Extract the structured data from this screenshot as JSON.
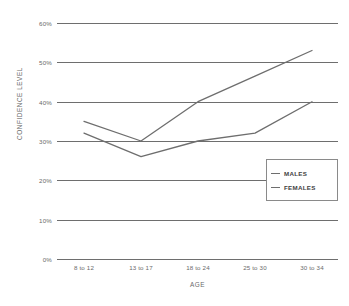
{
  "chart_data": {
    "type": "line",
    "title": "",
    "xlabel": "AGE",
    "ylabel": "CONFIDENCE LEVEL",
    "categories": [
      "8 to 12",
      "13 to 17",
      "18 to 24",
      "25 to 30",
      "30 to 34"
    ],
    "ylim": [
      0,
      60
    ],
    "ytick_labels": [
      "0%",
      "10%",
      "20%",
      "30%",
      "40%",
      "50%",
      "60%"
    ],
    "ytick_values": [
      0,
      10,
      20,
      30,
      40,
      50,
      60
    ],
    "grid": true,
    "legend_position": "right-middle",
    "series": [
      {
        "name": "MALES",
        "values": [
          35,
          30,
          40,
          46.5,
          53
        ],
        "color": "#6e6e6e"
      },
      {
        "name": "FEMALES",
        "values": [
          32,
          26,
          30,
          32,
          40
        ],
        "color": "#6e6e6e"
      }
    ]
  },
  "axes": {
    "y_title": "CONFIDENCE LEVEL",
    "x_title": "AGE",
    "y_ticks": [
      {
        "label": "60%",
        "value": 60
      },
      {
        "label": "50%",
        "value": 50
      },
      {
        "label": "40%",
        "value": 40
      },
      {
        "label": "30%",
        "value": 30
      },
      {
        "label": "20%",
        "value": 20
      },
      {
        "label": "10%",
        "value": 10
      },
      {
        "label": "0%",
        "value": 0
      }
    ],
    "x_ticks": [
      "8 to 12",
      "13 to 17",
      "18 to 24",
      "25 to 30",
      "30 to 34"
    ]
  },
  "legend": {
    "items": [
      {
        "label": "MALES",
        "color": "#6e6e6e"
      },
      {
        "label": "FEMALES",
        "color": "#6e6e6e"
      }
    ]
  },
  "colors": {
    "grid": "#6e6e6e",
    "text": "#6a6a6a",
    "legend_border": "#8a8a8a",
    "background": "#ffffff"
  }
}
